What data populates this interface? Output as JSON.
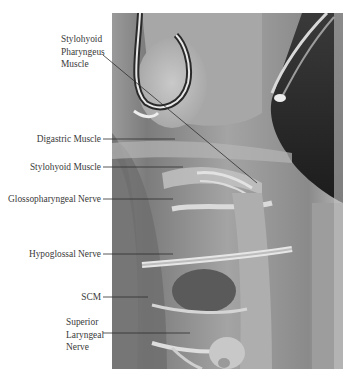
{
  "figure": {
    "type": "surgical-anatomy-photograph",
    "labels": [
      {
        "id": "stylohyoid-pharyngeus",
        "lines": [
          "Stylohyoid",
          "Pharyngeus",
          "Muscle"
        ]
      },
      {
        "id": "digastric",
        "text": "Digastric Muscle"
      },
      {
        "id": "stylohyoid",
        "text": "Stylohyoid Muscle"
      },
      {
        "id": "glossopharyngeal",
        "text": "Glossopharyngeal Nerve"
      },
      {
        "id": "hypoglossal",
        "text": "Hypoglossal Nerve"
      },
      {
        "id": "scm",
        "text": "SCM"
      },
      {
        "id": "superior-laryngeal",
        "lines": [
          "Superior",
          "Laryngeal",
          "Nerve"
        ]
      }
    ],
    "colors": {
      "background": "#ffffff",
      "label_text": "#3a3a3a",
      "leader_line": "#2e2e2e"
    }
  }
}
